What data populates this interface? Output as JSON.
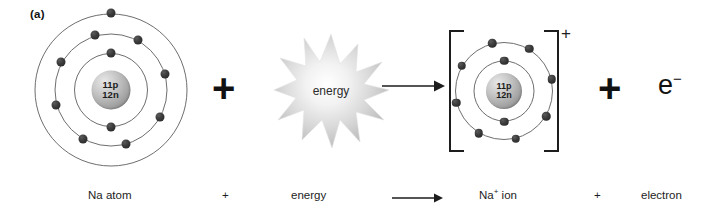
{
  "figure": {
    "panel_label": "(a)",
    "watermark": ""
  },
  "reactants": {
    "atom": {
      "name": "Na atom",
      "nucleus": {
        "protons_label": "11p",
        "neutrons_label": "12n"
      },
      "shell_electron_counts": [
        2,
        8,
        1
      ],
      "total_electrons": 11
    },
    "plus_symbol": "+",
    "energy": {
      "label": "energy",
      "shape": "starburst"
    }
  },
  "arrow": {
    "glyph": "→",
    "direction": "right"
  },
  "products": {
    "ion": {
      "name": "Na+ ion",
      "charge_symbol": "+",
      "nucleus": {
        "protons_label": "11p",
        "neutrons_label": "12n"
      },
      "shell_electron_counts": [
        2,
        8
      ],
      "total_electrons": 10,
      "brackets": true
    },
    "plus_symbol": "+",
    "electron": {
      "symbol_base": "e",
      "symbol_charge": "−"
    }
  },
  "caption": {
    "reactant_atom": "Na atom",
    "plus_1": "+",
    "reactant_energy": "energy",
    "product_ion_base": "Na",
    "product_ion_charge": "+",
    "product_ion_suffix": "ion",
    "plus_2": "+",
    "product_electron": "electron"
  },
  "colors": {
    "electron": "#2a2a2a",
    "shell_line": "#6e6e6e",
    "nucleus_light": "#e8e8e8",
    "nucleus_dark": "#7d7d7d",
    "text": "#1d1d1d",
    "starburst": "#d2d2d2",
    "background": "#ffffff"
  }
}
